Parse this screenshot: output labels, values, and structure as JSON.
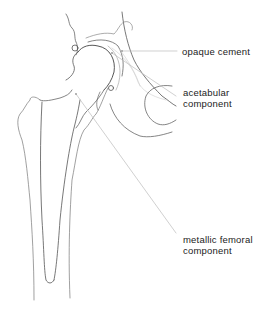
{
  "figure": {
    "labels": [
      {
        "id": "opaque-cement",
        "text": "opaque cement"
      },
      {
        "id": "acetabular-component",
        "line1": "acetabular",
        "line2": "component"
      },
      {
        "id": "metallic-femoral-component",
        "line1": "metallic femoral",
        "line2": "component"
      }
    ],
    "colors": {
      "line": "#555555",
      "leader": "#bbbbbb",
      "text": "#222222",
      "background": "#ffffff"
    }
  }
}
